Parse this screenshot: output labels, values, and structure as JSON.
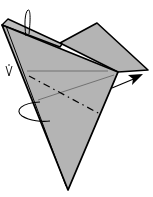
{
  "diagram": {
    "type": "origami-fold-step",
    "colors": {
      "paper": "#b4b4b4",
      "paper_back": "#c4c4c4",
      "outline": "#000000",
      "background": "#ffffff"
    },
    "elements": {
      "paper_model": "paper-model",
      "back_flap": "back-flap",
      "right_flap": "right-flap",
      "front_flap": "front-flap",
      "valley_fold_line": "valley-fold-line",
      "reference_lines": "reference-lines",
      "top_loop_arrow": "turn-over-arrow-top",
      "left_loop_arrow": "turn-over-arrow-left",
      "right_pointer_arrow": "fold-direction-arrow"
    }
  }
}
